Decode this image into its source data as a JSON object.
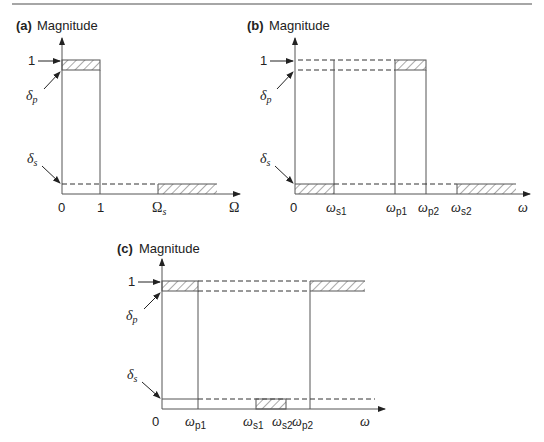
{
  "figure": {
    "panels": [
      {
        "id": "a",
        "tag": "(a)",
        "ylabel": "Magnitude",
        "type": "lowpass",
        "y_marks": {
          "one": "1",
          "delta_p": "δ",
          "delta_p_sub": "p",
          "delta_s": "δ",
          "delta_s_sub": "s"
        },
        "x_ticks": [
          {
            "label": "0"
          },
          {
            "label": "1"
          },
          {
            "label": "Ω",
            "sub": "s"
          }
        ],
        "x_axis_label": "Ω"
      },
      {
        "id": "b",
        "tag": "(b)",
        "ylabel": "Magnitude",
        "type": "bandpass",
        "y_marks": {
          "one": "1",
          "delta_p": "δ",
          "delta_p_sub": "p",
          "delta_s": "δ",
          "delta_s_sub": "s"
        },
        "x_ticks": [
          {
            "label": "0"
          },
          {
            "label": "ω",
            "sub": "s1"
          },
          {
            "label": "ω",
            "sub": "p1"
          },
          {
            "label": "ω",
            "sub": "p2"
          },
          {
            "label": "ω",
            "sub": "s2"
          }
        ],
        "x_axis_label": "ω"
      },
      {
        "id": "c",
        "tag": "(c)",
        "ylabel": "Magnitude",
        "type": "bandstop",
        "y_marks": {
          "one": "1",
          "delta_p": "δ",
          "delta_p_sub": "p",
          "delta_s": "δ",
          "delta_s_sub": "s"
        },
        "x_ticks": [
          {
            "label": "0"
          },
          {
            "label": "ω",
            "sub": "p1"
          },
          {
            "label": "ω",
            "sub": "s1"
          },
          {
            "label": "ω",
            "sub": "s2"
          },
          {
            "label": "ω",
            "sub": "p2"
          }
        ],
        "x_axis_label": "ω"
      }
    ],
    "colors": {
      "line": "#555555",
      "text": "#222222",
      "rule": "#888888"
    }
  }
}
